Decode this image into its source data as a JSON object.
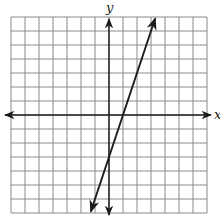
{
  "chart_data": {
    "type": "line",
    "title": "",
    "xlabel": "x",
    "ylabel": "y",
    "xlim": [
      -7,
      7
    ],
    "ylim": [
      -7,
      7
    ],
    "grid": true,
    "grid_step": 1,
    "tick_labels": false,
    "series": [
      {
        "name": "line",
        "equation": "y = 3x - 3",
        "slope": 3,
        "y_intercept": -3,
        "x_intercept": 1,
        "x": [
          -1.3,
          3.3
        ],
        "y": [
          -6.9,
          6.9
        ],
        "arrows_both_ends": true
      }
    ]
  },
  "labels": {
    "x_axis": "x",
    "y_axis": "y"
  },
  "colors": {
    "grid": "#8a8a8a",
    "axis": "#222222",
    "line": "#1a1a1a"
  }
}
